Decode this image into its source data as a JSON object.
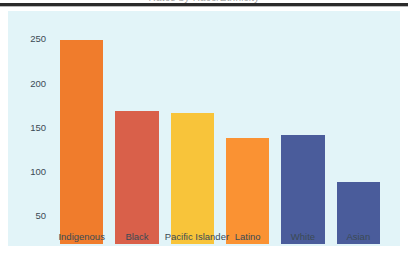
{
  "page": {
    "clipped_title_fragment": "Rates by Race/Ethnicity"
  },
  "colors": {
    "plot_background": "#E2F4F8",
    "page_background": "#FFFFFF",
    "rule": "#2B2B2B",
    "tick_text": "#3B4A55"
  },
  "chart_data": {
    "type": "bar",
    "title": "",
    "xlabel": "",
    "ylabel": "",
    "categories": [
      "Indigenous",
      "Black",
      "Pacific Islander",
      "Latino",
      "White",
      "Asian"
    ],
    "values": [
      260,
      180,
      178,
      150,
      153,
      100
    ],
    "colors": [
      "#F07C2C",
      "#D9604A",
      "#F8C43A",
      "#FA9233",
      "#4A5C9B",
      "#4A5C9B"
    ],
    "ytick_labels": [
      "250",
      "200",
      "150",
      "100",
      "50"
    ],
    "ytick_values": [
      250,
      200,
      150,
      100,
      50
    ],
    "ylim": [
      30,
      282
    ],
    "grid": false,
    "legend": "none"
  }
}
